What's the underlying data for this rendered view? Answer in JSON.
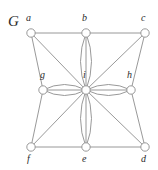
{
  "figure": {
    "name": "graph-figure",
    "width": 158,
    "height": 170,
    "background_color": "#ffffff",
    "line_color": "#8d8d8d",
    "text_color": "#2b2b2b"
  },
  "graph_name": {
    "text": "G",
    "x": 8,
    "y": 14
  },
  "vertices": [
    {
      "id": "a",
      "label": "a",
      "cx": 31,
      "cy": 33,
      "r": 4.2,
      "label_x": 26,
      "label_y": 13
    },
    {
      "id": "b",
      "label": "b",
      "cx": 86,
      "cy": 33,
      "r": 4.2,
      "label_x": 82,
      "label_y": 13
    },
    {
      "id": "c",
      "label": "c",
      "cx": 145,
      "cy": 33,
      "r": 4.2,
      "label_x": 141,
      "label_y": 13
    },
    {
      "id": "d",
      "label": "d",
      "cx": 145,
      "cy": 147,
      "r": 4.2,
      "label_x": 141,
      "label_y": 154
    },
    {
      "id": "e",
      "label": "e",
      "cx": 86,
      "cy": 147,
      "r": 4.2,
      "label_x": 82,
      "label_y": 154
    },
    {
      "id": "f",
      "label": "f",
      "cx": 31,
      "cy": 147,
      "r": 4.2,
      "label_x": 27,
      "label_y": 154
    },
    {
      "id": "g",
      "label": "g",
      "cx": 43,
      "cy": 90,
      "r": 4.2,
      "label_x": 40,
      "label_y": 70
    },
    {
      "id": "h",
      "label": "h",
      "cx": 131,
      "cy": 90,
      "r": 4.2,
      "label_x": 127,
      "label_y": 70
    },
    {
      "id": "i",
      "label": "i",
      "cx": 86,
      "cy": 90,
      "r": 4.2,
      "label_x": 83,
      "label_y": 70
    }
  ],
  "straight_edges": [
    {
      "from": "a",
      "to": "b"
    },
    {
      "from": "b",
      "to": "c"
    },
    {
      "from": "c",
      "to": "h"
    },
    {
      "from": "h",
      "to": "d"
    },
    {
      "from": "d",
      "to": "e"
    },
    {
      "from": "e",
      "to": "f"
    },
    {
      "from": "f",
      "to": "g"
    },
    {
      "from": "g",
      "to": "a"
    },
    {
      "from": "a",
      "to": "i"
    },
    {
      "from": "c",
      "to": "i"
    },
    {
      "from": "d",
      "to": "i"
    },
    {
      "from": "f",
      "to": "i"
    },
    {
      "from": "b",
      "to": "i"
    },
    {
      "from": "e",
      "to": "i"
    },
    {
      "from": "g",
      "to": "i"
    },
    {
      "from": "h",
      "to": "i"
    }
  ],
  "multi_edges": [
    {
      "from": "b",
      "to": "i",
      "bulge": 5.5,
      "count": 2,
      "shape": "lens"
    },
    {
      "from": "e",
      "to": "i",
      "bulge": 5.5,
      "count": 2,
      "shape": "lens"
    },
    {
      "from": "g",
      "to": "i",
      "bulge": 5.5,
      "count": 2,
      "shape": "lens"
    },
    {
      "from": "h",
      "to": "i",
      "bulge": 5.5,
      "count": 2,
      "shape": "lens"
    }
  ]
}
